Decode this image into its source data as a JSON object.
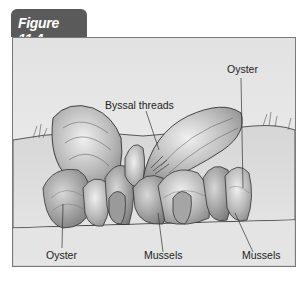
{
  "figure": {
    "tab_label": "Figure 11.4",
    "tab_color": "#5a5a5a",
    "frame_border_color": "#7a7a7a"
  },
  "labels": {
    "byssal_threads": "Byssal threads",
    "oyster_top_right": "Oyster",
    "oyster_bottom_left": "Oyster",
    "mussels_center": "Mussels",
    "mussels_right": "Mussels"
  }
}
